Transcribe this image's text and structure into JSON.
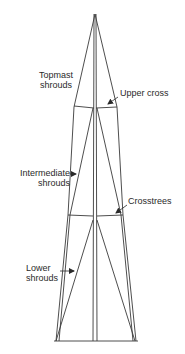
{
  "diagram": {
    "type": "mast-rigging",
    "colors": {
      "line": "#3a3a3a",
      "text": "#2a2a2a",
      "background": "#ffffff"
    },
    "labels": {
      "topmast_shrouds": {
        "line1": "Topmast",
        "line2": "shrouds"
      },
      "upper_cross": "Upper cross",
      "intermediate_shrouds": {
        "line1": "Intermediate",
        "line2": "shrouds"
      },
      "crosstrees": "Crosstrees",
      "lower_shrouds": {
        "line1": "Lower",
        "line2": "shrouds"
      }
    }
  }
}
